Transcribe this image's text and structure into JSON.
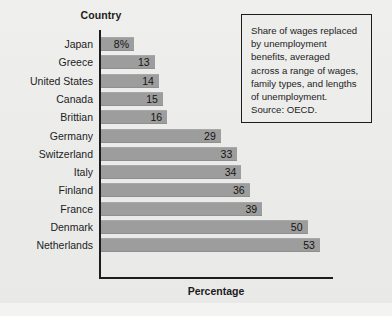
{
  "chart_data": {
    "type": "bar",
    "orientation": "horizontal",
    "title": "",
    "xlabel": "Percentage",
    "ylabel": "Country",
    "categories": [
      "Japan",
      "Greece",
      "United States",
      "Canada",
      "Brittian",
      "Germany",
      "Switzerland",
      "Italy",
      "Finland",
      "France",
      "Denmark",
      "Netherlands"
    ],
    "values": [
      8,
      13,
      14,
      15,
      16,
      29,
      33,
      34,
      36,
      39,
      50,
      53
    ],
    "value_labels": [
      "8%",
      "13",
      "14",
      "15",
      "16",
      "29",
      "33",
      "34",
      "36",
      "39",
      "50",
      "53"
    ],
    "xlim": [
      0,
      57
    ],
    "grid": false,
    "legend": false,
    "bar_color": "#9d9d9d",
    "axis_color": "#1d1d1d",
    "background_color": "#ededec",
    "annotation": "Share of wages replaced by unemployment benefits, averaged across a range of wages, family types, and lengths of unemployment. Source: OECD."
  },
  "axes": {
    "y_title": "Country",
    "x_title": "Percentage"
  },
  "caption": {
    "lines": [
      "Share of wages replaced",
      "by unemployment",
      "benefits, averaged",
      "across a range of wages,",
      "family types, and lengths",
      "of unemployment.",
      "Source: OECD."
    ]
  }
}
